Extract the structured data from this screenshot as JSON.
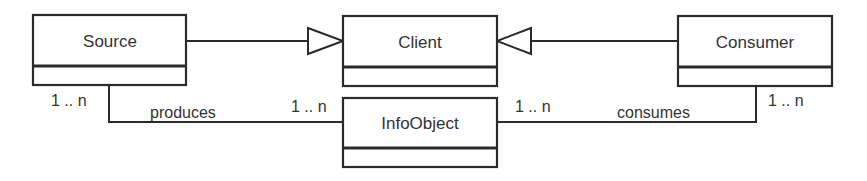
{
  "diagram": {
    "type": "uml-class-diagram",
    "classes": [
      {
        "id": "source",
        "name": "Source"
      },
      {
        "id": "client",
        "name": "Client"
      },
      {
        "id": "consumer",
        "name": "Consumer"
      },
      {
        "id": "infoobject",
        "name": "InfoObject"
      }
    ],
    "generalizations": [
      {
        "from": "Source",
        "to": "Client"
      },
      {
        "from": "Consumer",
        "to": "Client"
      }
    ],
    "associations": [
      {
        "name": "produces",
        "from": "Source",
        "to": "InfoObject",
        "from_multiplicity": "1 .. n",
        "to_multiplicity": "1 .. n"
      },
      {
        "name": "consumes",
        "from": "InfoObject",
        "to": "Consumer",
        "from_multiplicity": "1 .. n",
        "to_multiplicity": "1 .. n"
      }
    ]
  },
  "colors": {
    "stroke": "#2a2a2a",
    "text": "#333333",
    "background": "#ffffff"
  }
}
